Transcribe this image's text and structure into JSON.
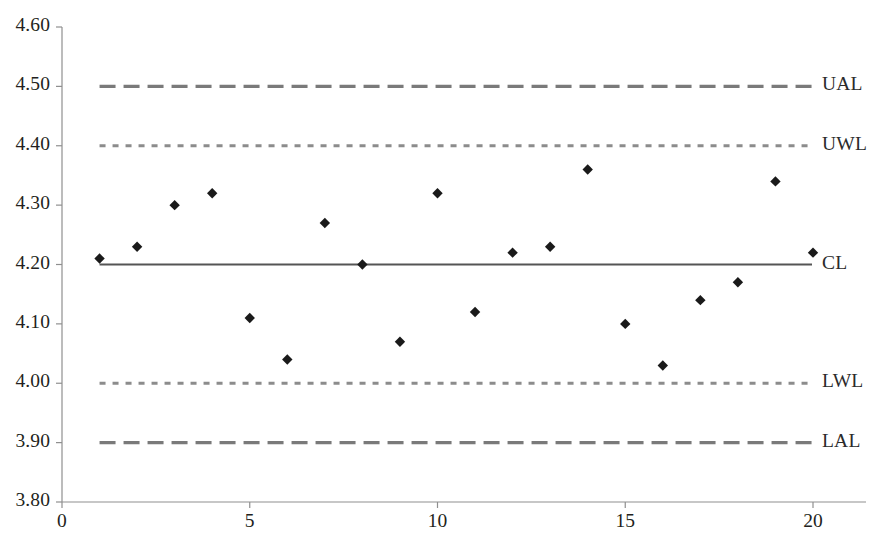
{
  "chart_data": {
    "type": "scatter",
    "title": "",
    "subtitle": "",
    "xlabel": "",
    "ylabel": "",
    "xlim": [
      0,
      20.9
    ],
    "ylim": [
      3.8,
      4.6
    ],
    "grid": false,
    "legend_position": "right-inline",
    "x_ticks": [
      "0",
      "5",
      "10",
      "15",
      "20"
    ],
    "x_tick_values": [
      0,
      5,
      10,
      15,
      20
    ],
    "y_ticks": [
      "3.80",
      "3.90",
      "4.00",
      "4.10",
      "4.20",
      "4.30",
      "4.40",
      "4.50",
      "4.60"
    ],
    "y_tick_values": [
      3.8,
      3.9,
      4.0,
      4.1,
      4.2,
      4.3,
      4.4,
      4.5,
      4.6
    ],
    "series": [
      {
        "name": "Sample measurements",
        "marker": "diamond",
        "color": "#1a1a1a",
        "x": [
          1,
          2,
          3,
          4,
          5,
          6,
          7,
          8,
          9,
          10,
          11,
          12,
          13,
          14,
          15,
          16,
          17,
          18,
          19,
          20
        ],
        "values": [
          4.21,
          4.23,
          4.3,
          4.32,
          4.11,
          4.04,
          4.27,
          4.2,
          4.07,
          4.32,
          4.12,
          4.22,
          4.23,
          4.36,
          4.1,
          4.03,
          4.14,
          4.17,
          4.34,
          4.22
        ]
      }
    ],
    "reference_lines": [
      {
        "id": "ual",
        "label": "UAL",
        "value": 4.5,
        "style": "dashed",
        "color": "#7a7a7a"
      },
      {
        "id": "uwl",
        "label": "UWL",
        "value": 4.4,
        "style": "dotted",
        "color": "#8c8c8c"
      },
      {
        "id": "cl",
        "label": "CL",
        "value": 4.2,
        "style": "solid",
        "color": "#555555"
      },
      {
        "id": "lwl",
        "label": "LWL",
        "value": 4.0,
        "style": "dotted",
        "color": "#8c8c8c"
      },
      {
        "id": "lal",
        "label": "LAL",
        "value": 3.9,
        "style": "dashed",
        "color": "#7a7a7a"
      }
    ]
  },
  "axes": {
    "axis_color": "#8f8f8f",
    "text_color": "#231f20"
  }
}
